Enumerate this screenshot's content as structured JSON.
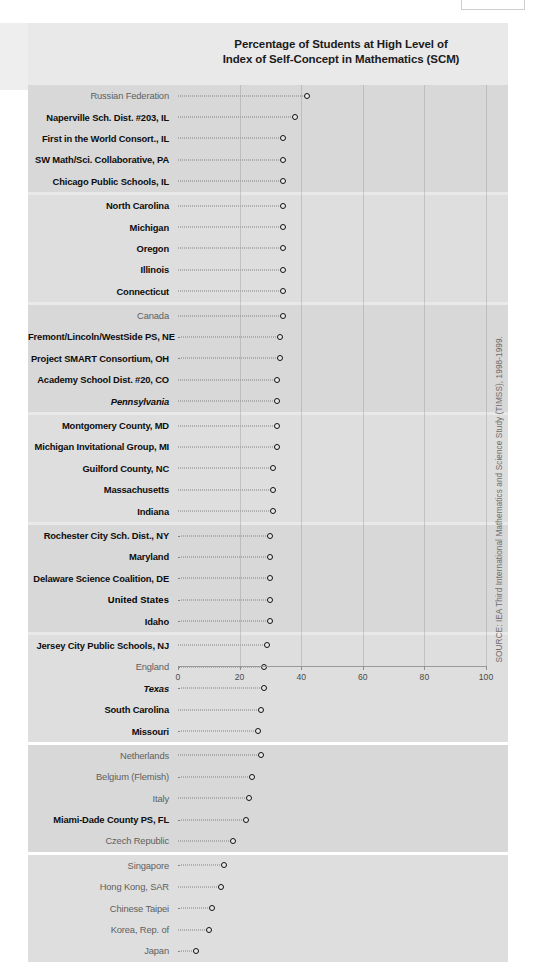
{
  "title_line1": "Percentage of Students at High Level of",
  "title_line2": "Index of Self-Concept in Mathematics (SCM)",
  "source_note": "SOURCE: IEA Third International Mathematics and Science Study (TIMSS), 1998-1999.",
  "axis": {
    "ticks": [
      "0",
      "20",
      "40",
      "60",
      "80",
      "100"
    ],
    "min": 0,
    "max": 100
  },
  "chart_data": {
    "type": "scatter",
    "title": "Percentage of Students at High Level of Index of Self-Concept in Mathematics (SCM)",
    "xlabel": "",
    "ylabel": "",
    "xlim": [
      0,
      100
    ],
    "grid": true,
    "legend": "none",
    "orientation": "horizontal-dot-plot",
    "categories": [
      "Russian Federation",
      "Naperville Sch. Dist. #203, IL",
      "First in the World Consort., IL",
      "SW Math/Sci. Collaborative, PA",
      "Chicago Public Schools, IL",
      "North Carolina",
      "Michigan",
      "Oregon",
      "Illinois",
      "Connecticut",
      "Canada",
      "Fremont/Lincoln/WestSide PS, NE",
      "Project SMART Consortium, OH",
      "Academy School Dist. #20, CO",
      "Pennsylvania",
      "Montgomery County, MD",
      "Michigan Invitational Group, MI",
      "Guilford County, NC",
      "Massachusetts",
      "Indiana",
      "Rochester City Sch. Dist., NY",
      "Maryland",
      "Delaware Science Coalition, DE",
      "United States",
      "Idaho",
      "Jersey City Public Schools, NJ",
      "England",
      "Texas",
      "South Carolina",
      "Missouri",
      "Netherlands",
      "Belgium (Flemish)",
      "Italy",
      "Miami-Dade County PS, FL",
      "Czech Republic",
      "Singapore",
      "Hong Kong, SAR",
      "Chinese Taipei",
      "Korea, Rep. of",
      "Japan"
    ],
    "values": [
      42,
      38,
      34,
      34,
      34,
      34,
      34,
      34,
      34,
      34,
      34,
      33,
      33,
      32,
      32,
      32,
      32,
      31,
      31,
      31,
      30,
      30,
      30,
      30,
      30,
      29,
      28,
      28,
      27,
      26,
      27,
      24,
      23,
      22,
      18,
      15,
      14,
      11,
      10,
      6
    ]
  },
  "rows": [
    {
      "label": "Russian Federation",
      "value": 42,
      "style": "plain"
    },
    {
      "label": "Naperville Sch. Dist. #203, IL",
      "value": 38,
      "style": "bold"
    },
    {
      "label": "First in the World Consort., IL",
      "value": 34,
      "style": "bold"
    },
    {
      "label": "SW Math/Sci. Collaborative, PA",
      "value": 34,
      "style": "bold"
    },
    {
      "label": "Chicago Public Schools, IL",
      "value": 34,
      "style": "bold"
    },
    {
      "label": "North Carolina",
      "value": 34,
      "style": "bold"
    },
    {
      "label": "Michigan",
      "value": 34,
      "style": "bold"
    },
    {
      "label": "Oregon",
      "value": 34,
      "style": "bold"
    },
    {
      "label": "Illinois",
      "value": 34,
      "style": "bold"
    },
    {
      "label": "Connecticut",
      "value": 34,
      "style": "bold"
    },
    {
      "label": "Canada",
      "value": 34,
      "style": "plain"
    },
    {
      "label": "Fremont/Lincoln/WestSide PS, NE",
      "value": 33,
      "style": "bold"
    },
    {
      "label": "Project SMART Consortium, OH",
      "value": 33,
      "style": "bold"
    },
    {
      "label": "Academy School Dist. #20, CO",
      "value": 32,
      "style": "bold"
    },
    {
      "label": "Pennsylvania",
      "value": 32,
      "style": "italic"
    },
    {
      "label": "Montgomery County, MD",
      "value": 32,
      "style": "bold"
    },
    {
      "label": "Michigan Invitational Group, MI",
      "value": 32,
      "style": "bold"
    },
    {
      "label": "Guilford County, NC",
      "value": 31,
      "style": "bold"
    },
    {
      "label": "Massachusetts",
      "value": 31,
      "style": "bold"
    },
    {
      "label": "Indiana",
      "value": 31,
      "style": "bold"
    },
    {
      "label": "Rochester City Sch. Dist., NY",
      "value": 30,
      "style": "bold"
    },
    {
      "label": "Maryland",
      "value": 30,
      "style": "bold"
    },
    {
      "label": "Delaware Science Coalition, DE",
      "value": 30,
      "style": "bold"
    },
    {
      "label": "United States",
      "value": 30,
      "style": "us"
    },
    {
      "label": "Idaho",
      "value": 30,
      "style": "bold"
    },
    {
      "label": "Jersey City Public Schools, NJ",
      "value": 29,
      "style": "bold"
    },
    {
      "label": "England",
      "value": 28,
      "style": "plain"
    },
    {
      "label": "Texas",
      "value": 28,
      "style": "italic"
    },
    {
      "label": "South Carolina",
      "value": 27,
      "style": "bold"
    },
    {
      "label": "Missouri",
      "value": 26,
      "style": "bold"
    },
    {
      "label": "Netherlands",
      "value": 27,
      "style": "plain"
    },
    {
      "label": "Belgium (Flemish)",
      "value": 24,
      "style": "plain"
    },
    {
      "label": "Italy",
      "value": 23,
      "style": "plain"
    },
    {
      "label": "Miami-Dade County PS, FL",
      "value": 22,
      "style": "bold"
    },
    {
      "label": "Czech Republic",
      "value": 18,
      "style": "plain"
    },
    {
      "label": "Singapore",
      "value": 15,
      "style": "plain"
    },
    {
      "label": "Hong Kong, SAR",
      "value": 14,
      "style": "plain"
    },
    {
      "label": "Chinese Taipei",
      "value": 11,
      "style": "plain"
    },
    {
      "label": "Korea, Rep. of",
      "value": 10,
      "style": "plain"
    },
    {
      "label": "Japan",
      "value": 6,
      "style": "plain"
    }
  ]
}
